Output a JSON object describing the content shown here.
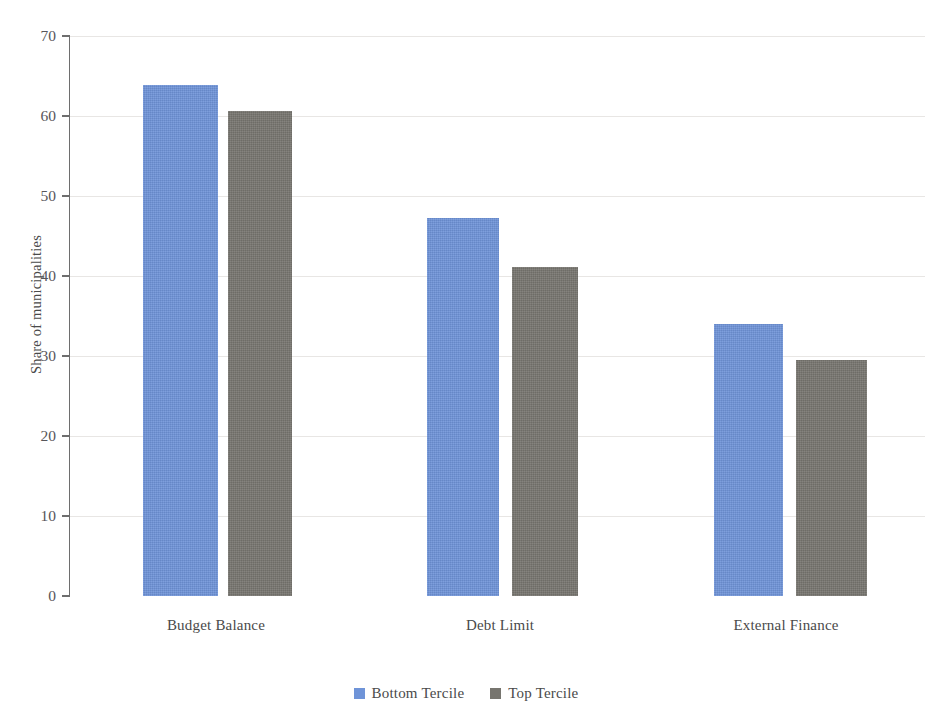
{
  "chart_data": {
    "type": "bar",
    "title": "",
    "subtitle": "",
    "xlabel": "",
    "ylabel": "Share of municipalities",
    "ylim": [
      0,
      70
    ],
    "ytick_interval": 10,
    "yticks": [
      0,
      10,
      20,
      30,
      40,
      50,
      60,
      70
    ],
    "ytick_labels": [
      "0",
      "10",
      "20",
      "30",
      "40",
      "50",
      "60",
      "70"
    ],
    "grid": true,
    "grid_axis": "y",
    "legend_position": "bottom-center",
    "categories": [
      "Budget Balance",
      "Debt Limit",
      "External Finance"
    ],
    "series": [
      {
        "name": "Bottom Tercile",
        "color": "#6f94d8",
        "values": [
          63.9,
          47.3,
          34.0
        ]
      },
      {
        "name": "Top Tercile",
        "color": "#77756f",
        "values": [
          60.6,
          41.1,
          29.5
        ]
      }
    ],
    "annotations": []
  },
  "colors": {
    "series_bottom_tercile": "#6f94d8",
    "series_top_tercile": "#77756f",
    "gridline": "#e8e6e4",
    "axis": "#6e6e6e",
    "text": "#4a4a4a",
    "background": "#ffffff"
  }
}
